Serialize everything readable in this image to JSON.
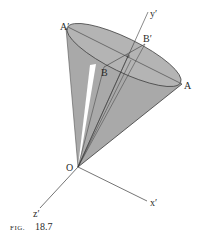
{
  "figure": {
    "caption_prefix": "FIG.",
    "caption_number": "18.7",
    "colors": {
      "cone_fill": "#a9a9a9",
      "rim_fill": "#b4b4b4",
      "highlight": "#ffffff",
      "line": "#3a3a3a"
    },
    "labels": {
      "A_prime": "A′",
      "A": "A",
      "B": "B",
      "B_prime": "B′",
      "y_prime": "y′",
      "O": "O",
      "x_prime": "x′",
      "z_prime": "z′"
    }
  }
}
